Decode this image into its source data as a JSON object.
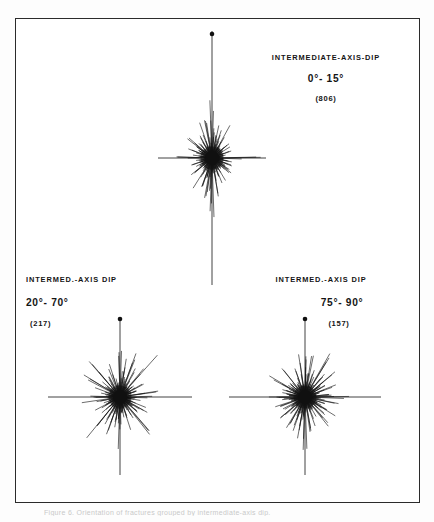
{
  "figure": {
    "background_color": "#fdfdfd",
    "frame_color": "#2b2b2b",
    "ink_color": "#111111",
    "caption": "Figure 6.  Orientation of fractures grouped by intermediate-axis dip."
  },
  "panels": [
    {
      "id": "top",
      "title": "INTERMEDIATE-AXIS-DIP",
      "range": "0°- 15°",
      "count": "(806)",
      "center_x": 212,
      "center_y": 158,
      "north_dot_y": 34
    },
    {
      "id": "bottom-left",
      "title": "INTERMED.-AXIS DIP",
      "range": "20°- 70°",
      "count": "(217)",
      "center_x": 120,
      "center_y": 397,
      "north_dot_y": 319
    },
    {
      "id": "bottom-right",
      "title": "INTERMED.-AXIS DIP",
      "range": "75°- 90°",
      "count": "(157)",
      "center_x": 305,
      "center_y": 397,
      "north_dot_y": 319
    }
  ],
  "chart_data": {
    "type": "rose",
    "xlabel": "",
    "ylabel": "",
    "grid": false,
    "legend": "none",
    "axis_note": "Each panel is a radial ray (spoke) plot: spoke length is proportional to the number of fractures in that azimuth bin. Long straight N-S and E-W reference lines cross each center; a filled dot marks north.",
    "panels": [
      {
        "name": "INTERMEDIATE-AXIS-DIP 0°- 15°",
        "sample_count": 806,
        "axis_lines": {
          "horizontal_half_length": 54,
          "vertical_half_length": 127
        },
        "max_spoke_length": 52,
        "bin_degrees": 5,
        "azimuths": [
          0,
          5,
          10,
          15,
          20,
          25,
          30,
          35,
          40,
          45,
          50,
          55,
          60,
          65,
          70,
          75,
          80,
          85,
          90,
          95,
          100,
          105,
          110,
          115,
          120,
          125,
          130,
          135,
          140,
          145,
          150,
          155,
          160,
          165,
          170,
          175,
          180,
          185,
          190,
          195,
          200,
          205,
          210,
          215,
          220,
          225,
          230,
          235,
          240,
          245,
          250,
          255,
          260,
          265,
          270,
          275,
          280,
          285,
          290,
          295,
          300,
          305,
          310,
          315,
          320,
          325,
          330,
          335,
          340,
          345,
          350,
          355
        ],
        "values": [
          52,
          30,
          38,
          22,
          27,
          17,
          34,
          14,
          20,
          11,
          25,
          13,
          18,
          9,
          23,
          12,
          16,
          8,
          44,
          10,
          18,
          9,
          22,
          12,
          16,
          20,
          28,
          13,
          19,
          10,
          24,
          12,
          32,
          15,
          40,
          18,
          52,
          30,
          38,
          22,
          27,
          17,
          34,
          14,
          20,
          11,
          25,
          13,
          18,
          9,
          23,
          12,
          16,
          8,
          44,
          10,
          18,
          9,
          22,
          12,
          16,
          20,
          28,
          13,
          19,
          10,
          24,
          12,
          32,
          15,
          40,
          18
        ]
      },
      {
        "name": "INTERMED.-AXIS DIP 20°- 70°",
        "sample_count": 217,
        "axis_lines": {
          "horizontal_half_length": 72,
          "vertical_half_length": 78
        },
        "max_spoke_length": 48,
        "bin_degrees": 5,
        "azimuths": [
          0,
          5,
          10,
          15,
          20,
          25,
          30,
          35,
          40,
          45,
          50,
          55,
          60,
          65,
          70,
          75,
          80,
          85,
          90,
          95,
          100,
          105,
          110,
          115,
          120,
          125,
          130,
          135,
          140,
          145,
          150,
          155,
          160,
          165,
          170,
          175,
          180,
          185,
          190,
          195,
          200,
          205,
          210,
          215,
          220,
          225,
          230,
          235,
          240,
          245,
          250,
          255,
          260,
          265,
          270,
          275,
          280,
          285,
          290,
          295,
          300,
          305,
          310,
          315,
          320,
          325,
          330,
          335,
          340,
          345,
          350,
          355
        ],
        "values": [
          46,
          26,
          34,
          19,
          40,
          16,
          30,
          13,
          48,
          12,
          22,
          10,
          26,
          14,
          18,
          9,
          34,
          11,
          30,
          14,
          20,
          10,
          24,
          11,
          38,
          16,
          20,
          12,
          44,
          15,
          24,
          10,
          30,
          13,
          20,
          16,
          46,
          26,
          34,
          19,
          40,
          16,
          30,
          13,
          48,
          12,
          22,
          10,
          26,
          14,
          18,
          9,
          34,
          11,
          30,
          14,
          20,
          10,
          24,
          11,
          38,
          16,
          20,
          12,
          44,
          15,
          24,
          10,
          30,
          13,
          20,
          16
        ]
      },
      {
        "name": "INTERMED.-AXIS DIP 75°- 90°",
        "sample_count": 157,
        "axis_lines": {
          "horizontal_half_length": 76,
          "vertical_half_length": 78
        },
        "max_spoke_length": 46,
        "bin_degrees": 5,
        "azimuths": [
          0,
          5,
          10,
          15,
          20,
          25,
          30,
          35,
          40,
          45,
          50,
          55,
          60,
          65,
          70,
          75,
          80,
          85,
          90,
          95,
          100,
          105,
          110,
          115,
          120,
          125,
          130,
          135,
          140,
          145,
          150,
          155,
          160,
          165,
          170,
          175,
          180,
          185,
          190,
          195,
          200,
          205,
          210,
          215,
          220,
          225,
          230,
          235,
          240,
          245,
          250,
          255,
          260,
          265,
          270,
          275,
          280,
          285,
          290,
          295,
          300,
          305,
          310,
          315,
          320,
          325,
          330,
          335,
          340,
          345,
          350,
          355
        ],
        "values": [
          44,
          20,
          36,
          15,
          30,
          18,
          42,
          14,
          26,
          12,
          34,
          16,
          22,
          10,
          28,
          13,
          18,
          24,
          40,
          14,
          30,
          12,
          20,
          15,
          36,
          17,
          24,
          11,
          32,
          13,
          20,
          14,
          26,
          12,
          38,
          16,
          44,
          20,
          36,
          15,
          30,
          18,
          42,
          14,
          26,
          12,
          34,
          16,
          22,
          10,
          28,
          13,
          18,
          24,
          40,
          14,
          30,
          12,
          20,
          15,
          36,
          17,
          24,
          11,
          32,
          13,
          20,
          14,
          26,
          12,
          38,
          16
        ]
      }
    ]
  }
}
